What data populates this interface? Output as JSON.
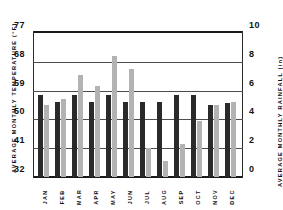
{
  "chart_data": {
    "type": "bar",
    "title": "",
    "subtitle": "",
    "xlabel": "",
    "categories": [
      "JAN",
      "FEB",
      "MAR",
      "APR",
      "MAY",
      "JUN",
      "JUL",
      "AUG",
      "SEP",
      "OCT",
      "NOV",
      "DEC"
    ],
    "grid": true,
    "legend": "none",
    "axes": {
      "left": {
        "label": "AVERAGE MONTHLY TEMPERATURE (°F)",
        "ticks": [
          32,
          41,
          50,
          59,
          68,
          77
        ],
        "ticklabels": [
          "32",
          "41",
          "50",
          "59",
          "68",
          "77"
        ],
        "range": [
          32,
          77
        ],
        "unit": "°F"
      },
      "right": {
        "label": "AVERAGE MONTHLY RAINFALL (in)",
        "ticks": [
          0,
          2,
          4,
          6,
          8,
          10
        ],
        "ticklabels": [
          "0",
          "2",
          "4",
          "6",
          "8",
          "10"
        ],
        "range": [
          0,
          10
        ],
        "unit": "in"
      }
    },
    "series": [
      {
        "name": "Average monthly temperature",
        "axis": "left",
        "unit": "°F",
        "color": "#2a2a2a",
        "values": [
          57.5,
          55.5,
          57.5,
          55.5,
          57.5,
          55.5,
          55.5,
          55.5,
          57.5,
          57.5,
          54.5,
          55.0
        ]
      },
      {
        "name": "Average monthly rainfall",
        "axis": "right",
        "unit": "in",
        "color": "#b3b3b3",
        "values": [
          5.0,
          5.4,
          7.1,
          6.3,
          8.4,
          7.5,
          2.0,
          1.1,
          2.3,
          3.9,
          5.0,
          5.2
        ]
      }
    ]
  },
  "labels": {
    "left_axis_title": "AVERAGE MONTHLY TEMPERATURE (°F)",
    "right_axis_title": "AVERAGE MONTHLY RAINFALL (in)"
  },
  "colors": {
    "temperature_bar": "#2a2a2a",
    "rainfall_bar": "#b3b3b3",
    "axis": "#1a1a1a",
    "gridline": "#4d4d4d",
    "background": "#ffffff"
  }
}
